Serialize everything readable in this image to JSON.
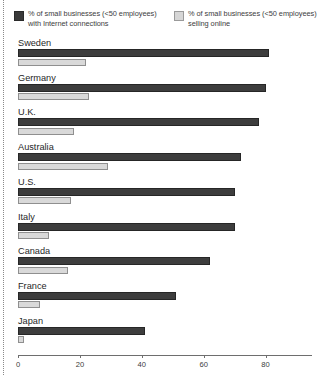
{
  "legend": {
    "entries": [
      {
        "swatch": "dark-swatch",
        "label": "% of small businesses (<50 employees) with Internet connections"
      },
      {
        "swatch": "light-swatch",
        "label": "% of small businesses (<50 employees) selling online"
      }
    ]
  },
  "axis": {
    "ticks": [
      "0",
      "20",
      "40",
      "60",
      "80"
    ]
  },
  "chart_data": {
    "type": "bar",
    "title": "",
    "xlabel": "",
    "ylabel": "",
    "orientation": "horizontal",
    "grid": false,
    "legend_position": "top",
    "xlim": [
      0,
      95
    ],
    "xticks": [
      0,
      20,
      40,
      60,
      80
    ],
    "categories": [
      "Sweden",
      "Germany",
      "U.K.",
      "Australia",
      "U.S.",
      "Italy",
      "Canada",
      "France",
      "Japan"
    ],
    "series": [
      {
        "name": "% of small businesses (<50 employees) with Internet connections",
        "color": "#3d3d3d",
        "values": [
          81,
          80,
          78,
          72,
          70,
          70,
          62,
          51,
          41
        ]
      },
      {
        "name": "% of small businesses (<50 employees) selling online",
        "color": "#d9d9d9",
        "values": [
          22,
          23,
          18,
          29,
          17,
          10,
          16,
          7,
          2
        ]
      }
    ]
  }
}
